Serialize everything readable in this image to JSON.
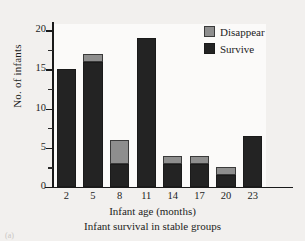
{
  "chart_data": {
    "type": "bar",
    "title": "",
    "subtitle": "Infant survival in stable groups",
    "xlabel": "Infant age (months)",
    "ylabel": "No. of infants",
    "categories": [
      "2",
      "5",
      "8",
      "11",
      "14",
      "17",
      "20",
      "23"
    ],
    "series": [
      {
        "name": "Survive",
        "color": "#232323",
        "values": [
          15,
          16,
          3,
          19,
          3,
          3,
          1.5,
          6.5
        ]
      },
      {
        "name": "Disappear",
        "color": "#8e8e8e",
        "values": [
          0,
          1,
          3,
          0,
          1,
          1,
          1,
          0
        ]
      }
    ],
    "totals": [
      15,
      17,
      6,
      19,
      4,
      4,
      2.5,
      6.5
    ],
    "stacked": true,
    "ylim": [
      0,
      20.8
    ],
    "yticks": [
      0,
      5,
      10,
      15,
      20
    ],
    "yticks_minor": [
      2.5,
      7.5,
      12.5,
      17.5
    ],
    "ytick_labels": [
      "0",
      "5",
      "10",
      "15",
      "20"
    ],
    "grid": false,
    "legend_position": "top-right"
  },
  "legend": {
    "entries": [
      {
        "label": "Disappear",
        "swatch": "disappear-swatch"
      },
      {
        "label": "Survive",
        "swatch": "survive-swatch"
      }
    ]
  },
  "figure": {
    "corner_mark": "(a)"
  }
}
